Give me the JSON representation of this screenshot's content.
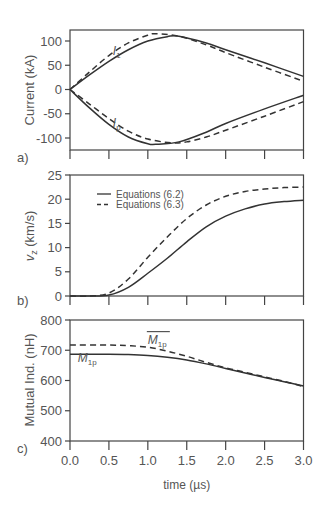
{
  "figure": {
    "xlabel": "time (µs)",
    "x_ticks": [
      "0.0",
      "0.5",
      "1.0",
      "1.5",
      "2.0",
      "2.5",
      "3.0"
    ],
    "colors": {
      "line": "#333333",
      "axis": "#444444",
      "text": "#555555"
    }
  },
  "chart_data": [
    {
      "panel": "a)",
      "type": "line",
      "title": "",
      "xlabel": "time (µs)",
      "ylabel": "Current (kA)",
      "xlim": [
        0,
        3
      ],
      "ylim": [
        -125,
        125
      ],
      "y_ticks": [
        "100",
        "50",
        "0",
        "-50",
        "-100"
      ],
      "y_tick_values": [
        100,
        50,
        0,
        -50,
        -100
      ],
      "annotations": [
        {
          "text": "I",
          "sub": "1",
          "x": 0.55,
          "y": 72
        },
        {
          "text": "I",
          "sub": "p",
          "x": 0.55,
          "y": -78
        }
      ],
      "series": [
        {
          "name": "I1 Equations (6.2)",
          "style": "solid",
          "x": [
            0,
            0.25,
            0.5,
            0.75,
            1.0,
            1.25,
            1.4,
            1.75,
            2.0,
            2.5,
            3.0
          ],
          "y": [
            0,
            30,
            58,
            82,
            100,
            109,
            110,
            96,
            82,
            55,
            27
          ]
        },
        {
          "name": "I1 Equations (6.3)",
          "style": "dashed",
          "x": [
            0,
            0.25,
            0.5,
            0.75,
            1.0,
            1.1,
            1.4,
            1.75,
            2.0,
            2.5,
            3.0
          ],
          "y": [
            0,
            36,
            70,
            96,
            112,
            115,
            110,
            92,
            76,
            46,
            17
          ]
        },
        {
          "name": "Ip Equations (6.2)",
          "style": "solid",
          "x": [
            0,
            0.25,
            0.5,
            0.75,
            1.0,
            1.1,
            1.4,
            1.75,
            2.0,
            2.5,
            3.0
          ],
          "y": [
            0,
            -38,
            -72,
            -98,
            -112,
            -113,
            -108,
            -88,
            -70,
            -40,
            -12
          ]
        },
        {
          "name": "Ip Equations (6.3)",
          "style": "dashed",
          "x": [
            0,
            0.25,
            0.5,
            0.75,
            1.0,
            1.3,
            1.5,
            1.75,
            2.0,
            2.5,
            3.0
          ],
          "y": [
            0,
            -30,
            -60,
            -86,
            -102,
            -110,
            -108,
            -98,
            -84,
            -55,
            -25
          ]
        }
      ]
    },
    {
      "panel": "b)",
      "type": "line",
      "title": "",
      "xlabel": "time (µs)",
      "ylabel": "v_z (km/s)",
      "ylabel_main": "v",
      "ylabel_sub": "z",
      "ylabel_rest": " (km/s)",
      "xlim": [
        0,
        3
      ],
      "ylim": [
        0,
        25
      ],
      "y_ticks": [
        "25",
        "20",
        "15",
        "10",
        "5",
        "0"
      ],
      "y_tick_values": [
        25,
        20,
        15,
        10,
        5,
        0
      ],
      "legend": {
        "position": "upper left",
        "entries": [
          {
            "label": "Equations (6.2)",
            "style": "solid"
          },
          {
            "label": "Equations (6.3)",
            "style": "dashed"
          }
        ]
      },
      "series": [
        {
          "name": "Equations (6.2)",
          "style": "solid",
          "x": [
            0,
            0.25,
            0.5,
            0.75,
            1.0,
            1.25,
            1.5,
            1.75,
            2.0,
            2.25,
            2.5,
            2.75,
            3.0
          ],
          "y": [
            0,
            0,
            0.2,
            1.8,
            4.7,
            7.8,
            11.2,
            14.3,
            16.5,
            18.0,
            19.0,
            19.5,
            19.8
          ]
        },
        {
          "name": "Equations (6.3)",
          "style": "dashed",
          "x": [
            0,
            0.25,
            0.5,
            0.75,
            1.0,
            1.25,
            1.5,
            1.75,
            2.0,
            2.25,
            2.5,
            2.75,
            3.0
          ],
          "y": [
            0,
            0,
            0.6,
            3.5,
            8.0,
            12.2,
            16.0,
            18.8,
            20.6,
            21.6,
            22.1,
            22.4,
            22.5
          ]
        }
      ]
    },
    {
      "panel": "c)",
      "type": "line",
      "title": "",
      "xlabel": "time (µs)",
      "ylabel": "Mutual Ind. (nH)",
      "xlim": [
        0,
        3
      ],
      "ylim": [
        400,
        800
      ],
      "y_ticks": [
        "800",
        "700",
        "600",
        "500",
        "400"
      ],
      "y_tick_values": [
        800,
        700,
        600,
        500,
        400
      ],
      "annotations": [
        {
          "text": "M",
          "sub": "1p",
          "overline": true,
          "x": 1.0,
          "y": 722
        },
        {
          "text": "M",
          "sub": "1p",
          "overline": false,
          "x": 0.1,
          "y": 660
        }
      ],
      "series": [
        {
          "name": "M1p",
          "style": "solid",
          "x": [
            0,
            0.5,
            0.75,
            1.0,
            1.25,
            1.5,
            1.75,
            2.0,
            2.25,
            2.5,
            2.75,
            3.0
          ],
          "y": [
            687,
            687,
            686,
            683,
            677,
            668,
            655,
            640,
            625,
            610,
            596,
            582
          ]
        },
        {
          "name": "M1p (bar)",
          "style": "dashed",
          "x": [
            0,
            0.5,
            0.75,
            1.0,
            1.25,
            1.5,
            1.75,
            2.0,
            2.25,
            2.5,
            2.75,
            3.0
          ],
          "y": [
            717,
            717,
            715,
            710,
            697,
            680,
            660,
            642,
            627,
            612,
            597,
            580
          ]
        }
      ]
    }
  ]
}
